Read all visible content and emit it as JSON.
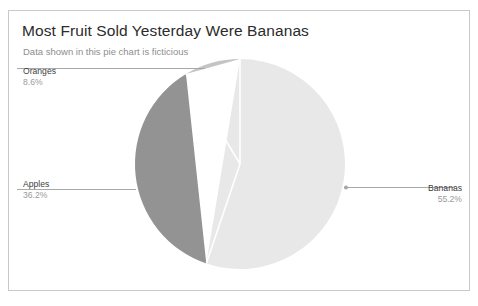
{
  "card": {
    "title": "Most Fruit Sold Yesterday Were Bananas",
    "subtitle": "Data shown in this pie chart is ficticious"
  },
  "labels": {
    "oranges": {
      "name": "Oranges",
      "value": "8.6%"
    },
    "apples": {
      "name": "Apples",
      "value": "36.2%"
    },
    "bananas": {
      "name": "Bananas",
      "value": "55.2%"
    }
  },
  "chart_data": {
    "type": "pie",
    "title": "Most Fruit Sold Yesterday Were Bananas",
    "subtitle": "Data shown in this pie chart is ficticious",
    "unit": "percent",
    "start_angle_deg": 0,
    "direction": "clockwise",
    "legend": "labels-with-leader-lines",
    "grid": false,
    "categories": [
      "Bananas",
      "Apples",
      "Oranges"
    ],
    "values": [
      55.2,
      36.2,
      8.6
    ],
    "labels": [
      "55.2%",
      "36.2%",
      "8.6%"
    ],
    "colors": [
      "#e8e8e8",
      "#939393",
      "#c4c4c4"
    ],
    "slices": [
      {
        "name": "Bananas",
        "value": 55.2,
        "label": "55.2%",
        "color": "#e8e8e8"
      },
      {
        "name": "Apples",
        "value": 36.2,
        "label": "36.2%",
        "color": "#939393"
      },
      {
        "name": "Oranges",
        "value": 8.6,
        "label": "8.6%",
        "color": "#c4c4c4"
      }
    ]
  },
  "colors": {
    "card_border": "#c9c9c9",
    "title_text": "#2b2b2b",
    "subtitle_text": "#8e8e8e",
    "label_name": "#3d3d3d",
    "label_value": "#9a9a9a",
    "leader_line": "#a8a8a8",
    "slice_separator": "#ffffff"
  }
}
